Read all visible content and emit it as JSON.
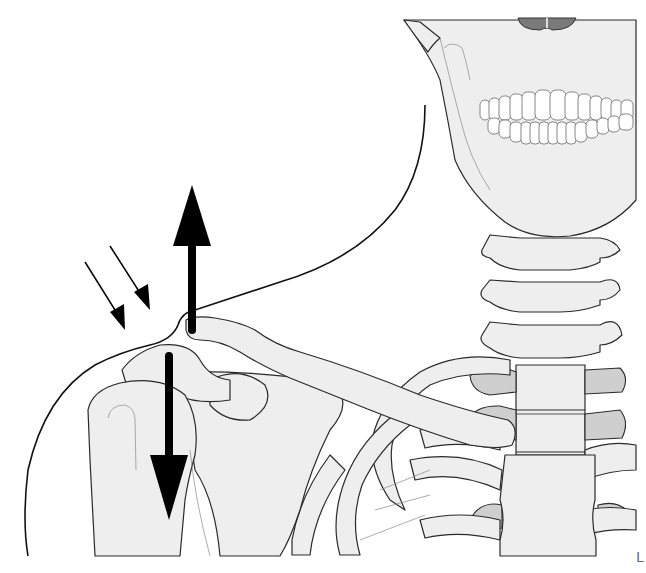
{
  "figure": {
    "colors": {
      "bone_fill": "#eeeeee",
      "cartilage_fill": "#cfcfcf",
      "nasal_cavity": "#7a7a7a",
      "outline": "#111111",
      "arrow": "#000000",
      "background": "#ffffff"
    },
    "arrows": [
      {
        "name": "upward-force-arrow",
        "direction": "up",
        "style": "thick",
        "location": "lateral clavicle end"
      },
      {
        "name": "downward-force-arrow",
        "direction": "down",
        "style": "thick",
        "location": "humeral head / arm"
      },
      {
        "name": "pressure-arrow-1",
        "direction": "down-right",
        "style": "thin",
        "location": "above acromion"
      },
      {
        "name": "pressure-arrow-2",
        "direction": "down-right",
        "style": "thin",
        "location": "above acromion"
      }
    ],
    "structures": [
      "skull-mandible",
      "teeth",
      "cervical-vertebrae",
      "clavicle",
      "acromion",
      "scapula",
      "humerus",
      "ribs",
      "sternum",
      "costal-cartilage",
      "skin-contour"
    ],
    "corner_mark": "L"
  }
}
